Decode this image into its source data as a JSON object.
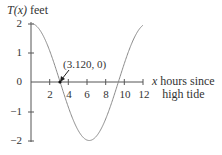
{
  "chart_data": {
    "type": "line",
    "title": "",
    "ylabel_var": "T(x)",
    "ylabel_unit": "feet",
    "ylabel": "T(x) feet",
    "xlabel": "x hours since high tide",
    "xlabel_line1": "x hours since",
    "xlabel_line2": "high tide",
    "xlim": [
      0,
      12
    ],
    "ylim": [
      -2,
      2
    ],
    "x_ticks": [
      2,
      4,
      6,
      8,
      10,
      12
    ],
    "x_tick_labels": [
      "2",
      "4",
      "6",
      "8",
      "10",
      "12"
    ],
    "y_ticks": [
      2,
      1,
      0,
      -1,
      -2
    ],
    "y_tick_labels": [
      "2",
      "1",
      "0",
      "−1",
      "−2"
    ],
    "grid": false,
    "legend": null,
    "series": [
      {
        "name": "T(x)",
        "function": "2*cos(2*pi*x/12.48)",
        "x": [
          0,
          1,
          2,
          3,
          3.12,
          4,
          5,
          6,
          6.24,
          7,
          8,
          9,
          9.36,
          10,
          11,
          12
        ],
        "y": [
          2.0,
          1.76,
          1.09,
          0.13,
          0.0,
          -0.43,
          -1.32,
          -2.0,
          -2.0,
          -1.86,
          -1.23,
          -0.4,
          0.0,
          0.42,
          1.36,
          1.96
        ]
      }
    ],
    "annotations": [
      {
        "text": "(3.120, 0)",
        "x": 3.12,
        "y": 0,
        "arrow": true
      }
    ]
  }
}
